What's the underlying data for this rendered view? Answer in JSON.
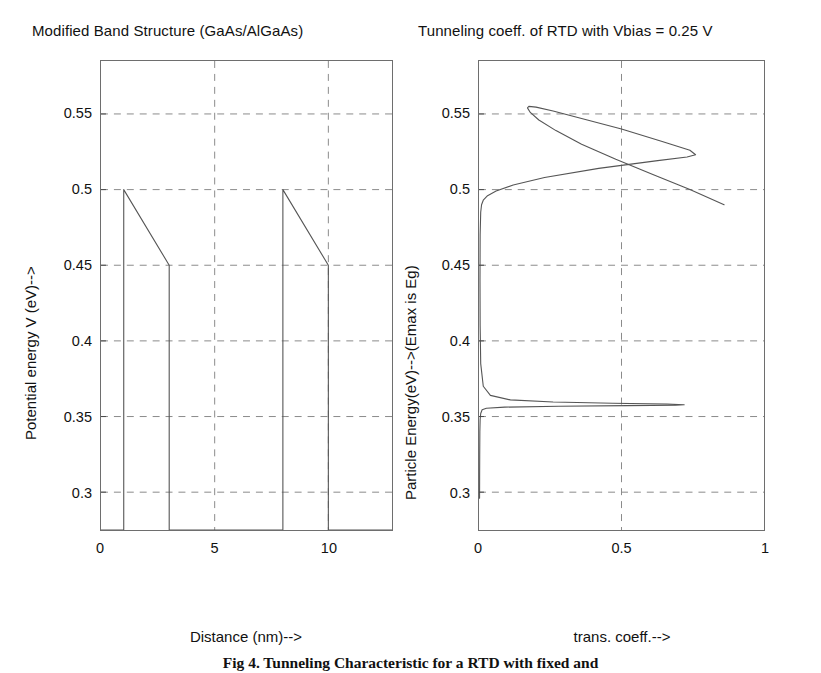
{
  "figure": {
    "caption": "Fig 4. Tunneling Characteristic for a RTD with fixed and",
    "left_title": "Modified Band Structure (GaAs/AlGaAs)",
    "right_title": "Tunneling coeff. of RTD with Vbias = 0.25 V",
    "line_color": "#555555",
    "grid_color": "#8a8a8a",
    "frame_color": "#6e6e6e"
  },
  "chart_data": [
    {
      "type": "line",
      "title": "Modified Band Structure (GaAs/AlGaAs)",
      "xlabel": "Distance (nm)-->",
      "ylabel": "Potential energy V (eV)-->",
      "xlim": [
        0,
        12.8
      ],
      "ylim": [
        0.275,
        0.585
      ],
      "xticks": [
        0,
        5,
        10
      ],
      "xticklabels": [
        "0",
        "5",
        "10"
      ],
      "yticks": [
        0.3,
        0.35,
        0.4,
        0.45,
        0.5,
        0.55
      ],
      "yticklabels": [
        "0.3",
        "0.35",
        "0.4",
        "0.45",
        "0.5",
        "0.55"
      ],
      "grid": true,
      "legend": "none",
      "series": [
        {
          "name": "Biased double-barrier potential profile",
          "x": [
            0,
            1,
            1,
            3,
            3,
            8,
            8,
            10,
            10,
            12.8
          ],
          "y": [
            0.275,
            0.275,
            0.5,
            0.45,
            0.275,
            0.275,
            0.5,
            0.45,
            0.275,
            0.275
          ]
        }
      ],
      "annotations": [
        "Barrier 1 spans x = 1 to 3 nm, top sloping 0.5 to 0.45 eV",
        "Barrier 2 spans x = 8 to 10 nm, top sloping 0.5 to 0.45 eV",
        "Well region between 3 and 8 nm"
      ]
    },
    {
      "type": "line",
      "title": "Tunneling coeff. of RTD with Vbias = 0.25 V",
      "xlabel": "trans. coeff.-->",
      "ylabel": "Particle Energy(eV)-->(Emax is Eg)",
      "xlim": [
        0,
        1
      ],
      "ylim": [
        0.275,
        0.585
      ],
      "xticks": [
        0,
        0.5,
        1
      ],
      "xticklabels": [
        "0",
        "0.5",
        "1"
      ],
      "yticks": [
        0.3,
        0.35,
        0.4,
        0.45,
        0.5,
        0.55
      ],
      "yticklabels": [
        "0.3",
        "0.35",
        "0.4",
        "0.45",
        "0.5",
        "0.55"
      ],
      "grid": true,
      "legend": "none",
      "orientation": "energy-on-y",
      "series": [
        {
          "name": "Transmission coefficient T(E)",
          "energy": [
            0.296,
            0.31,
            0.325,
            0.34,
            0.348,
            0.352,
            0.3545,
            0.3555,
            0.3562,
            0.3568,
            0.3572,
            0.3575,
            0.3578,
            0.3582,
            0.3588,
            0.3596,
            0.361,
            0.364,
            0.37,
            0.385,
            0.41,
            0.44,
            0.47,
            0.485,
            0.49,
            0.493,
            0.496,
            0.499,
            0.503,
            0.508,
            0.514,
            0.519,
            0.5215,
            0.523,
            0.526,
            0.532,
            0.54,
            0.547,
            0.552,
            0.5545,
            0.555,
            0.554,
            0.551,
            0.546,
            0.539,
            0.53,
            0.52,
            0.51,
            0.5,
            0.49
          ],
          "trans": [
            0.002,
            0.0022,
            0.0025,
            0.003,
            0.004,
            0.006,
            0.011,
            0.026,
            0.09,
            0.28,
            0.52,
            0.69,
            0.72,
            0.66,
            0.47,
            0.26,
            0.11,
            0.04,
            0.015,
            0.006,
            0.004,
            0.0035,
            0.004,
            0.006,
            0.009,
            0.015,
            0.03,
            0.06,
            0.12,
            0.23,
            0.42,
            0.62,
            0.73,
            0.76,
            0.74,
            0.64,
            0.5,
            0.36,
            0.26,
            0.2,
            0.175,
            0.17,
            0.18,
            0.21,
            0.27,
            0.36,
            0.48,
            0.61,
            0.74,
            0.86
          ]
        }
      ],
      "annotations": [
        "Sharp first resonance near E = 0.357 eV reaching T ~ 0.72",
        "Broad second resonance peaking at T ~ 0.76 near E = 0.523 eV",
        "Curve turns back near E = 0.555 eV at T ~ 0.17 and rises off the top of the axes"
      ]
    }
  ]
}
